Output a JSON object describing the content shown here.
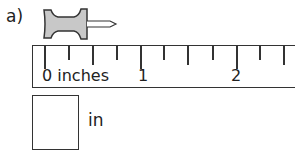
{
  "question": {
    "label": "a)",
    "object": "pushpin",
    "answer_value": "",
    "answer_unit": "in"
  },
  "ruler": {
    "labels": [
      {
        "text": "0 inches",
        "x": 9
      },
      {
        "text": "1",
        "x": 105
      },
      {
        "text": "2",
        "x": 198
      }
    ],
    "ticks": [
      {
        "x": 11,
        "h": 23
      },
      {
        "x": 35,
        "h": 14
      },
      {
        "x": 59,
        "h": 19
      },
      {
        "x": 83,
        "h": 14
      },
      {
        "x": 107,
        "h": 23
      },
      {
        "x": 130,
        "h": 14
      },
      {
        "x": 154,
        "h": 19
      },
      {
        "x": 179,
        "h": 14
      },
      {
        "x": 203,
        "h": 23
      },
      {
        "x": 226,
        "h": 14
      },
      {
        "x": 250,
        "h": 19
      }
    ]
  },
  "colors": {
    "pin_fill": "#c8c8c8",
    "stroke": "#333333"
  }
}
